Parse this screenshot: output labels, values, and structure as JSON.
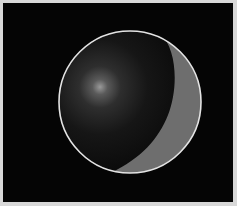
{
  "scene": {
    "description": "Shaded sphere with lit crescent on black background",
    "background_color": "#050505",
    "frame_color": "#d8d8d8",
    "sphere": {
      "cx": 130,
      "cy": 102,
      "r": 71,
      "dark_color": "#0e0e0e",
      "mid_color": "#2a2a2a",
      "highlight_color": "#8a8a8a",
      "highlight_cx": 100,
      "highlight_cy": 87,
      "outline_color": "#e6e6e6",
      "outline_width": 1.6
    },
    "crescent": {
      "color": "#6f6f6f",
      "side": "right"
    }
  }
}
